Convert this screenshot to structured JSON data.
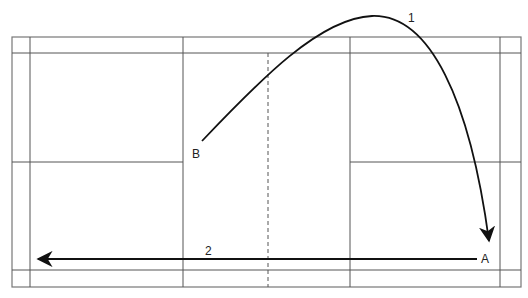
{
  "diagram": {
    "title": "",
    "court": {
      "outer": {
        "x1": 12,
        "y1": 37,
        "x2": 521,
        "y2": 287
      },
      "verticals": [
        30,
        183,
        350,
        500
      ],
      "horizontals_full": [
        53,
        270
      ],
      "mid_horizontal": {
        "y": 162,
        "segments": [
          [
            12,
            183
          ],
          [
            350,
            521
          ]
        ]
      },
      "center_dashed_x": 268
    },
    "labels": {
      "point_a": "A",
      "point_b": "B",
      "shot_1": "1",
      "shot_2": "2"
    },
    "shots": [
      {
        "id": "1",
        "type": "curve",
        "from": "B",
        "to": "A",
        "description": "high lob from B over net to rear court near A"
      },
      {
        "id": "2",
        "type": "straight",
        "from": "A",
        "to": "rear-left",
        "description": "straight return across the court"
      }
    ],
    "colors": {
      "line": "#555555",
      "shot": "#111111",
      "background": "#ffffff"
    }
  }
}
